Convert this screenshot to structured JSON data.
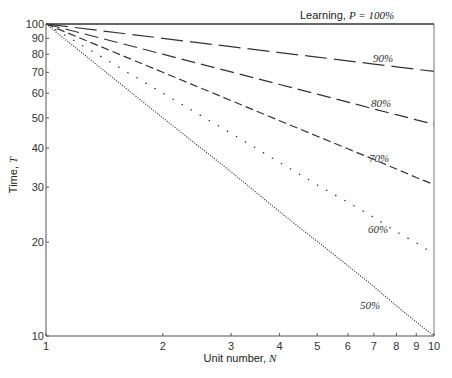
{
  "chart_data": {
    "type": "line",
    "title": "",
    "xlabel": "Unit number,",
    "xlabel_var": "N",
    "ylabel": "Time,",
    "ylabel_var": "T",
    "xscale": "log",
    "yscale": "log",
    "xlim": [
      1,
      10
    ],
    "ylim": [
      10,
      100
    ],
    "grid": false,
    "x_ticks": [
      1,
      2,
      3,
      4,
      5,
      6,
      7,
      8,
      9,
      10
    ],
    "y_ticks": [
      10,
      20,
      30,
      40,
      50,
      60,
      70,
      80,
      90,
      100
    ],
    "legend_prefix": "Learning,",
    "legend_var": "P =",
    "x": [
      1,
      2,
      3,
      4,
      5,
      6,
      7,
      8,
      9,
      10
    ],
    "series": [
      {
        "name": "100%",
        "style": "solid",
        "values": [
          100,
          100,
          100,
          100,
          100,
          100,
          100,
          100,
          100,
          100
        ]
      },
      {
        "name": "90%",
        "style": "long-dash",
        "values": [
          100,
          90,
          84.6,
          81,
          78.3,
          76.2,
          74.4,
          72.9,
          71.6,
          70.5
        ]
      },
      {
        "name": "80%",
        "style": "dash",
        "values": [
          100,
          80,
          70.2,
          64,
          59.6,
          56.2,
          53.4,
          51.2,
          49.3,
          47.7
        ]
      },
      {
        "name": "70%",
        "style": "short-dash",
        "values": [
          100,
          70,
          56.8,
          49,
          43.7,
          39.8,
          36.8,
          34.3,
          32.2,
          30.6
        ]
      },
      {
        "name": "60%",
        "style": "dotted-sparse",
        "values": [
          100,
          60,
          44.6,
          36,
          30.5,
          26.8,
          24,
          21.6,
          19.9,
          18.3
        ]
      },
      {
        "name": "50%",
        "style": "dotted-dense",
        "values": [
          100,
          50,
          33.6,
          25,
          20.1,
          16.8,
          14.4,
          12.5,
          11.1,
          10
        ]
      }
    ],
    "annotations": [
      {
        "text": "100%",
        "x": 10,
        "y": 100,
        "position": "above top-right"
      },
      {
        "text": "90%",
        "x": 7.6,
        "y": 78
      },
      {
        "text": "80%",
        "x": 7.6,
        "y": 58
      },
      {
        "text": "70%",
        "x": 7.6,
        "y": 37
      },
      {
        "text": "60%",
        "x": 7.6,
        "y": 23
      },
      {
        "text": "50%",
        "x": 7.6,
        "y": 15
      }
    ]
  }
}
